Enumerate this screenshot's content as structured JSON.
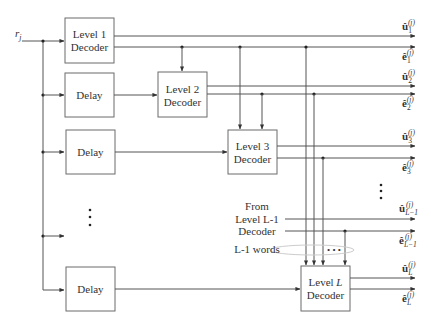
{
  "diagram": {
    "input_label": "r_j",
    "input_label_text": "r",
    "input_label_sub": "j",
    "blocks": [
      {
        "id": "level1",
        "line1": "Level 1",
        "line2": "Decoder"
      },
      {
        "id": "delay1",
        "line1": "Delay"
      },
      {
        "id": "level2",
        "line1": "Level 2",
        "line2": "Decoder"
      },
      {
        "id": "delay2",
        "line1": "Delay"
      },
      {
        "id": "level3",
        "line1": "Level 3",
        "line2": "Decoder"
      },
      {
        "id": "delayL",
        "line1": "Delay"
      },
      {
        "id": "levelL",
        "line1": "Level ",
        "line1_italic": "L",
        "line2": "Decoder"
      }
    ],
    "outputs": [
      {
        "sym": "û",
        "sub": "1",
        "sup": "(j)"
      },
      {
        "sym": "ê",
        "sub": "1",
        "sup": "(j)"
      },
      {
        "sym": "û",
        "sub": "2",
        "sup": "(j)"
      },
      {
        "sym": "ê",
        "sub": "2",
        "sup": "(j)"
      },
      {
        "sym": "û",
        "sub": "3",
        "sup": "(j)"
      },
      {
        "sym": "ê",
        "sub": "3",
        "sup": "(j)"
      },
      {
        "sym": "û",
        "sub": "L−1",
        "sup": "(j)"
      },
      {
        "sym": "ê",
        "sub": "L−1",
        "sup": "(j)"
      },
      {
        "sym": "û",
        "sub": "L",
        "sup": "(j)"
      },
      {
        "sym": "ê",
        "sub": "L",
        "sup": "(j)"
      }
    ],
    "annotations": {
      "from_line1": "From",
      "from_line2": "Level L-1",
      "from_line3": "Decoder",
      "words": "L-1 words",
      "ellipsis": "• • •"
    }
  }
}
